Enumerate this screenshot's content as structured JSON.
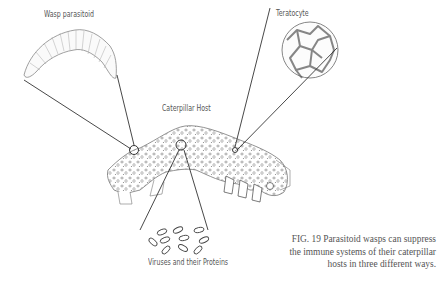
{
  "labels": {
    "wasp": "Wasp parasitoid",
    "teratocyte": "Teratocyte",
    "host": "Caterpillar Host",
    "viruses": "Viruses and their Proteins"
  },
  "caption": {
    "line1": "FIG. 19  Parasitoid wasps can suppress",
    "line2": "the immune systems of their caterpillar",
    "line3": "hosts in three different ways."
  },
  "colors": {
    "ink": "#333333",
    "text": "#555555",
    "background": "#ffffff"
  }
}
